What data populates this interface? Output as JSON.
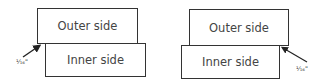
{
  "diagrams": [
    {
      "outer": {
        "label": "Outer side"
      },
      "inner": {
        "label": "Inner side"
      },
      "offset_label": "¹⁄₁₆\""
    },
    {
      "outer": {
        "label": "Outer side"
      },
      "inner": {
        "label": "Inner side"
      },
      "offset_label": "¹⁄₁₆\""
    }
  ],
  "colors": {
    "line": "#333333",
    "text": "#444444"
  }
}
